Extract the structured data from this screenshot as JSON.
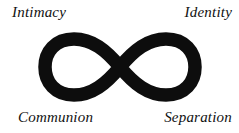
{
  "diagram": {
    "title_visible": false,
    "background_color": "#ffffff",
    "symbol": {
      "name": "infinity-symbol",
      "glyph": "∞",
      "color": "#0d0d0d",
      "stroke_width": 13.5,
      "center_x": 120,
      "center_y": 67,
      "left_extent": 40,
      "right_extent": 200,
      "top_extent": 37,
      "bottom_extent": 98
    },
    "labels": {
      "top_left": "Intimacy",
      "top_right": "Identity",
      "bottom_left": "Communion",
      "bottom_right": "Separation"
    }
  }
}
